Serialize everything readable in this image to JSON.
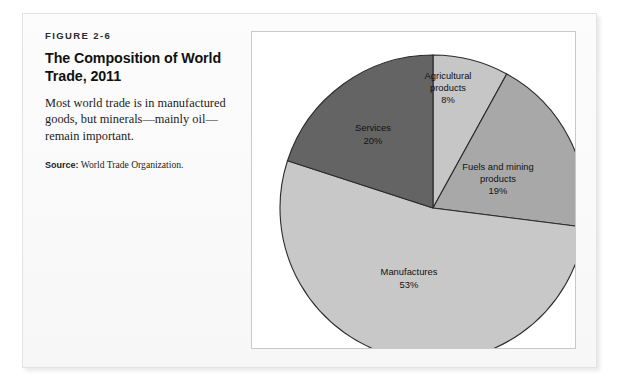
{
  "figure": {
    "number": "FIGURE 2-6",
    "title": "The Composition of World Trade, 2011",
    "description": "Most world trade is in manufactured goods, but minerals—mainly oil—remain important.",
    "source_label": "Source:",
    "source_text": " World Trade Organization."
  },
  "chart_data": {
    "type": "pie",
    "title": "The Composition of World Trade, 2011",
    "categories": [
      "Agricultural products",
      "Fuels and mining products",
      "Manufactures",
      "Services"
    ],
    "values": [
      8,
      19,
      53,
      20
    ],
    "value_labels": [
      "8%",
      "19%",
      "53%",
      "20%"
    ],
    "unit": "%",
    "start_angle_deg": 0,
    "direction": "clockwise",
    "legend": "none (labels drawn inside slices)",
    "colors": [
      "#c6c6c6",
      "#a8a8a8",
      "#c8c8c8",
      "#646464"
    ],
    "stroke_color": "#2a2a2a",
    "slices": [
      {
        "label_line1": "Agricultural",
        "label_line2": "products",
        "value_label": "8%",
        "value": 8,
        "color": "#c6c6c6",
        "label_x": 196,
        "label_y": 47,
        "label_x2": 196,
        "label_y2": 59,
        "value_x": 196,
        "value_y": 71
      },
      {
        "label_line1": "Fuels and mining",
        "label_line2": "products",
        "value_label": "19%",
        "value": 19,
        "color": "#a8a8a8",
        "label_x": 246,
        "label_y": 138,
        "label_x2": 246,
        "label_y2": 150,
        "value_x": 246,
        "value_y": 162
      },
      {
        "label_line1": "Manufactures",
        "label_line2": "",
        "value_label": "53%",
        "value": 53,
        "color": "#c8c8c8",
        "label_x": 157,
        "label_y": 243,
        "label_x2": 157,
        "label_y2": 243,
        "value_x": 157,
        "value_y": 256
      },
      {
        "label_line1": "Services",
        "label_line2": "",
        "value_label": "20%",
        "value": 20,
        "color": "#646464",
        "label_x": 121,
        "label_y": 99,
        "label_x2": 121,
        "label_y2": 99,
        "value_x": 121,
        "value_y": 112
      }
    ],
    "geometry": {
      "center_x": 181,
      "center_y": 176,
      "radius": 153
    }
  }
}
